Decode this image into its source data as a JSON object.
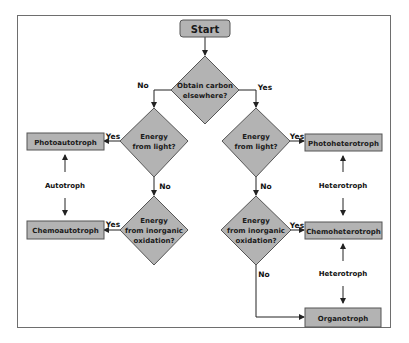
{
  "diagram": {
    "type": "flowchart",
    "title": "Start",
    "colors": {
      "node_fill": "#b3b3b3",
      "node_stroke": "#555555",
      "text": "#1a1a1a",
      "line": "#222222",
      "frame": "#6e6e6e"
    },
    "nodes": {
      "start": {
        "label": "Start"
      },
      "q_carbon": {
        "line1": "Obtain carbon",
        "line2": "elsewhere?"
      },
      "q_light_left": {
        "line1": "Energy",
        "line2": "from light?"
      },
      "q_inorg_left": {
        "line1": "Energy",
        "line2": "from inorganic",
        "line3": "oxidation?"
      },
      "q_light_right": {
        "line1": "Energy",
        "line2": "from light?"
      },
      "q_inorg_right": {
        "line1": "Energy",
        "line2": "from inorganic",
        "line3": "oxidation?"
      },
      "photoautotroph": {
        "label": "Photoautotroph"
      },
      "chemoautotroph": {
        "label": "Chemoautotroph"
      },
      "photoheterotroph": {
        "label": "Photoheterotroph"
      },
      "chemoheterotroph": {
        "label": "Chemoheterotroph"
      },
      "organotroph": {
        "label": "Organotroph"
      }
    },
    "edge_labels": {
      "carbon_no": "No",
      "carbon_yes": "Yes",
      "light_left_yes": "Yes",
      "light_left_no": "No",
      "inorg_left_yes": "Yes",
      "light_right_yes": "Yes",
      "light_right_no": "No",
      "inorg_right_yes": "Yes",
      "inorg_right_no": "No"
    },
    "group_labels": {
      "autotroph": "Autotroph",
      "heterotroph_upper": "Heterotroph",
      "heterotroph_lower": "Heterotroph"
    },
    "edges": [
      {
        "from": "start",
        "to": "q_carbon"
      },
      {
        "from": "q_carbon",
        "to": "q_light_left",
        "label": "No"
      },
      {
        "from": "q_carbon",
        "to": "q_light_right",
        "label": "Yes"
      },
      {
        "from": "q_light_left",
        "to": "photoautotroph",
        "label": "Yes"
      },
      {
        "from": "q_light_left",
        "to": "q_inorg_left",
        "label": "No"
      },
      {
        "from": "q_inorg_left",
        "to": "chemoautotroph",
        "label": "Yes"
      },
      {
        "from": "q_light_right",
        "to": "photoheterotroph",
        "label": "Yes"
      },
      {
        "from": "q_light_right",
        "to": "q_inorg_right",
        "label": "No"
      },
      {
        "from": "q_inorg_right",
        "to": "chemoheterotroph",
        "label": "Yes"
      },
      {
        "from": "q_inorg_right",
        "to": "organotroph",
        "label": "No"
      }
    ]
  }
}
